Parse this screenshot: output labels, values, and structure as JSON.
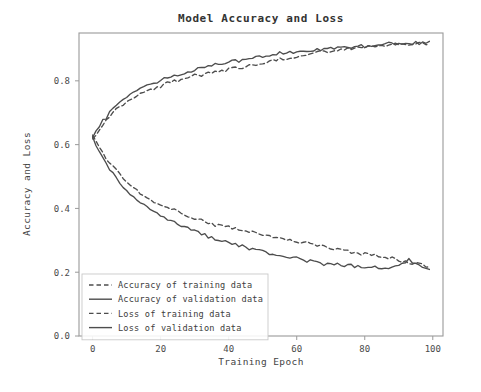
{
  "chart_data": {
    "type": "line",
    "title": "Model Accuracy and Loss",
    "xlabel": "Training Epoch",
    "ylabel": "Accuracy and Loss",
    "xlim": [
      -4,
      103
    ],
    "ylim": [
      0.0,
      0.95
    ],
    "xticks": [
      0,
      20,
      40,
      60,
      80,
      100
    ],
    "xticklabels": [
      "0",
      "20",
      "40",
      "60",
      "80",
      "100"
    ],
    "yticks": [
      0.0,
      0.2,
      0.4,
      0.6,
      0.8
    ],
    "yticklabels": [
      "0.0",
      "0.2",
      "0.4",
      "0.6",
      "0.8"
    ],
    "grid": false,
    "legend_position": "lower left",
    "line_color": "#4d4d4d",
    "x": [
      0,
      1,
      2,
      3,
      4,
      5,
      6,
      7,
      8,
      9,
      10,
      11,
      12,
      13,
      14,
      15,
      16,
      17,
      18,
      19,
      20,
      21,
      22,
      23,
      24,
      25,
      26,
      27,
      28,
      29,
      30,
      31,
      32,
      33,
      34,
      35,
      36,
      37,
      38,
      39,
      40,
      41,
      42,
      43,
      44,
      45,
      46,
      47,
      48,
      49,
      50,
      51,
      52,
      53,
      54,
      55,
      56,
      57,
      58,
      59,
      60,
      61,
      62,
      63,
      64,
      65,
      66,
      67,
      68,
      69,
      70,
      71,
      72,
      73,
      74,
      75,
      76,
      77,
      78,
      79,
      80,
      81,
      82,
      83,
      84,
      85,
      86,
      87,
      88,
      89,
      90,
      91,
      92,
      93,
      94,
      95,
      96,
      97,
      98,
      99
    ],
    "series": [
      {
        "name": "Accuracy of training data",
        "style": "dashed",
        "values": [
          0.618,
          0.632,
          0.651,
          0.663,
          0.678,
          0.69,
          0.701,
          0.71,
          0.719,
          0.727,
          0.735,
          0.742,
          0.748,
          0.753,
          0.759,
          0.764,
          0.769,
          0.773,
          0.777,
          0.781,
          0.785,
          0.789,
          0.792,
          0.795,
          0.798,
          0.801,
          0.804,
          0.807,
          0.809,
          0.812,
          0.814,
          0.817,
          0.819,
          0.821,
          0.823,
          0.825,
          0.827,
          0.829,
          0.831,
          0.833,
          0.835,
          0.837,
          0.839,
          0.841,
          0.843,
          0.845,
          0.847,
          0.849,
          0.851,
          0.853,
          0.855,
          0.857,
          0.859,
          0.861,
          0.863,
          0.865,
          0.867,
          0.869,
          0.871,
          0.873,
          0.875,
          0.877,
          0.879,
          0.881,
          0.883,
          0.885,
          0.887,
          0.888,
          0.89,
          0.891,
          0.893,
          0.894,
          0.896,
          0.897,
          0.899,
          0.9,
          0.901,
          0.902,
          0.903,
          0.904,
          0.905,
          0.906,
          0.907,
          0.908,
          0.909,
          0.91,
          0.911,
          0.912,
          0.913,
          0.913,
          0.914,
          0.915,
          0.915,
          0.916,
          0.917,
          0.917,
          0.918,
          0.918,
          0.919,
          0.92
        ]
      },
      {
        "name": "Accuracy of validation data",
        "style": "solid",
        "values": [
          0.622,
          0.641,
          0.659,
          0.672,
          0.686,
          0.699,
          0.712,
          0.722,
          0.731,
          0.74,
          0.748,
          0.755,
          0.762,
          0.768,
          0.774,
          0.779,
          0.784,
          0.789,
          0.793,
          0.797,
          0.801,
          0.805,
          0.809,
          0.812,
          0.816,
          0.819,
          0.822,
          0.826,
          0.829,
          0.831,
          0.834,
          0.837,
          0.839,
          0.842,
          0.844,
          0.847,
          0.849,
          0.851,
          0.853,
          0.856,
          0.858,
          0.86,
          0.862,
          0.864,
          0.866,
          0.868,
          0.869,
          0.871,
          0.873,
          0.875,
          0.876,
          0.878,
          0.879,
          0.881,
          0.882,
          0.884,
          0.885,
          0.886,
          0.888,
          0.889,
          0.89,
          0.891,
          0.893,
          0.894,
          0.895,
          0.896,
          0.897,
          0.898,
          0.899,
          0.9,
          0.901,
          0.902,
          0.903,
          0.904,
          0.905,
          0.906,
          0.907,
          0.908,
          0.908,
          0.909,
          0.91,
          0.911,
          0.911,
          0.912,
          0.913,
          0.913,
          0.914,
          0.915,
          0.915,
          0.916,
          0.916,
          0.917,
          0.917,
          0.918,
          0.918,
          0.919,
          0.919,
          0.92,
          0.92,
          0.921
        ]
      },
      {
        "name": "Loss of training data",
        "style": "dashed",
        "values": [
          0.63,
          0.612,
          0.592,
          0.574,
          0.558,
          0.543,
          0.529,
          0.516,
          0.504,
          0.493,
          0.483,
          0.473,
          0.464,
          0.456,
          0.448,
          0.441,
          0.434,
          0.428,
          0.422,
          0.416,
          0.411,
          0.406,
          0.401,
          0.396,
          0.392,
          0.388,
          0.384,
          0.38,
          0.376,
          0.373,
          0.369,
          0.366,
          0.363,
          0.36,
          0.357,
          0.354,
          0.351,
          0.348,
          0.346,
          0.343,
          0.341,
          0.338,
          0.336,
          0.333,
          0.331,
          0.329,
          0.327,
          0.324,
          0.322,
          0.32,
          0.318,
          0.316,
          0.314,
          0.312,
          0.31,
          0.308,
          0.306,
          0.304,
          0.302,
          0.3,
          0.298,
          0.296,
          0.294,
          0.292,
          0.29,
          0.288,
          0.286,
          0.284,
          0.282,
          0.28,
          0.278,
          0.276,
          0.274,
          0.272,
          0.27,
          0.268,
          0.266,
          0.264,
          0.262,
          0.26,
          0.258,
          0.256,
          0.254,
          0.252,
          0.25,
          0.248,
          0.246,
          0.244,
          0.242,
          0.24,
          0.238,
          0.236,
          0.234,
          0.232,
          0.23,
          0.228,
          0.226,
          0.224,
          0.222,
          0.22
        ]
      },
      {
        "name": "Loss of validation data",
        "style": "solid",
        "values": [
          0.625,
          0.6,
          0.576,
          0.556,
          0.537,
          0.52,
          0.506,
          0.492,
          0.479,
          0.467,
          0.456,
          0.446,
          0.437,
          0.428,
          0.42,
          0.412,
          0.404,
          0.397,
          0.39,
          0.383,
          0.377,
          0.371,
          0.366,
          0.361,
          0.356,
          0.351,
          0.346,
          0.341,
          0.337,
          0.333,
          0.329,
          0.325,
          0.321,
          0.317,
          0.313,
          0.31,
          0.306,
          0.303,
          0.299,
          0.296,
          0.293,
          0.29,
          0.287,
          0.284,
          0.281,
          0.278,
          0.275,
          0.272,
          0.27,
          0.267,
          0.264,
          0.262,
          0.259,
          0.257,
          0.254,
          0.252,
          0.25,
          0.248,
          0.246,
          0.244,
          0.242,
          0.24,
          0.238,
          0.236,
          0.235,
          0.233,
          0.231,
          0.23,
          0.228,
          0.227,
          0.226,
          0.224,
          0.223,
          0.222,
          0.221,
          0.22,
          0.219,
          0.218,
          0.218,
          0.217,
          0.216,
          0.216,
          0.215,
          0.215,
          0.214,
          0.214,
          0.214,
          0.215,
          0.216,
          0.218,
          0.222,
          0.228,
          0.234,
          0.238,
          0.235,
          0.228,
          0.22,
          0.213,
          0.207,
          0.203
        ]
      }
    ],
    "legend_entries": [
      {
        "label": "Accuracy of training data",
        "style": "dashed"
      },
      {
        "label": "Accuracy of validation data",
        "style": "solid"
      },
      {
        "label": "Loss of training data",
        "style": "dashed"
      },
      {
        "label": "Loss of validation data",
        "style": "solid"
      }
    ]
  }
}
